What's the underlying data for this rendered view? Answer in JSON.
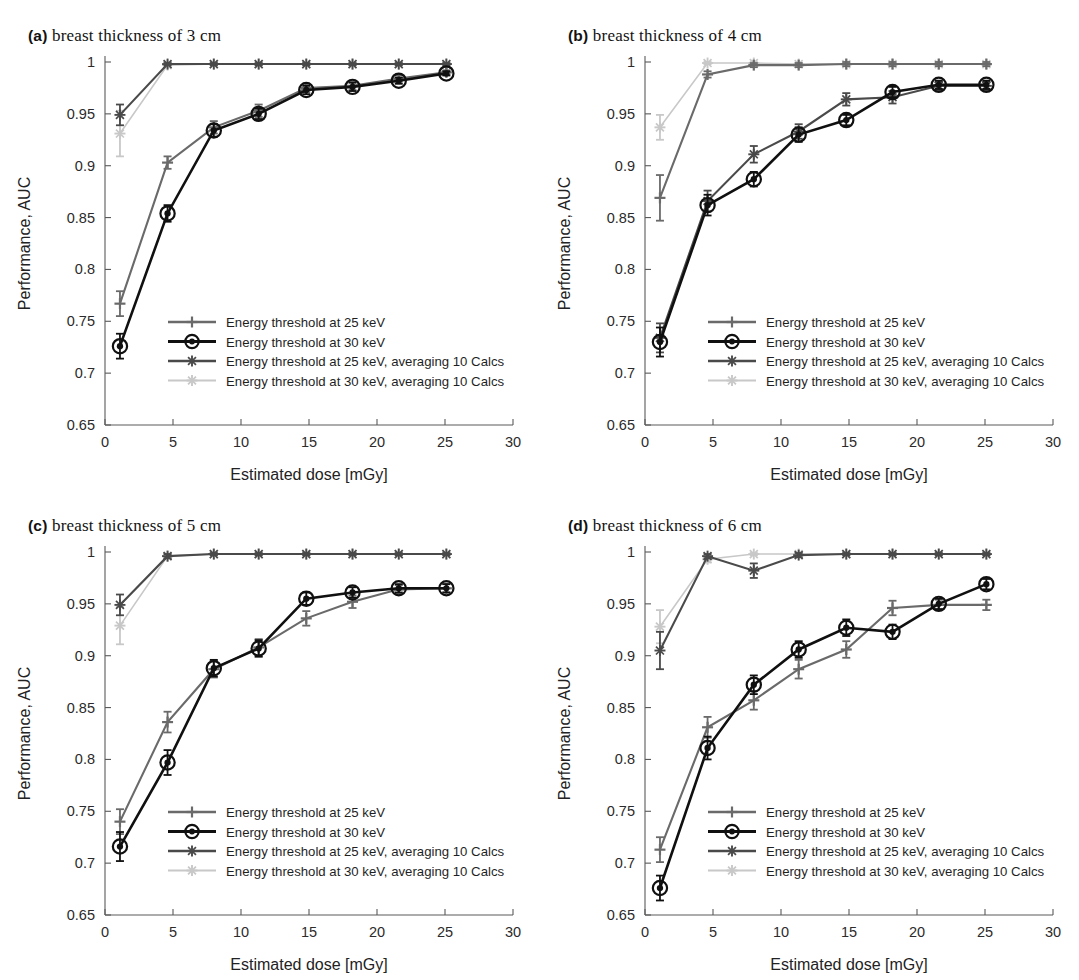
{
  "figure": {
    "axis": {
      "xlabel": "Estimated dose [mGy]",
      "ylabel": "Performance, AUC",
      "xlim": [
        0,
        30
      ],
      "ylim": [
        0.65,
        1.0
      ],
      "xticks": [
        "0",
        "5",
        "10",
        "15",
        "20",
        "25",
        "30"
      ],
      "xtick_values": [
        0,
        5,
        10,
        15,
        20,
        25,
        30
      ],
      "yticks": [
        "0.65",
        "0.7",
        "0.75",
        "0.8",
        "0.85",
        "0.9",
        "0.95",
        "1"
      ],
      "ytick_values": [
        0.65,
        0.7,
        0.75,
        0.8,
        0.85,
        0.9,
        0.95,
        1.0
      ],
      "grid": false
    },
    "legend": {
      "position": "lower-right-inside",
      "entries": [
        {
          "label": "Energy threshold at 25 keV",
          "marker": "plus",
          "color": "#6a6a6a"
        },
        {
          "label": "Energy threshold at 30 keV",
          "marker": "circle",
          "color": "#101010"
        },
        {
          "label": "Energy threshold at 25 keV, averaging 10 Calcs",
          "marker": "star",
          "color": "#4a4a4a"
        },
        {
          "label": "Energy threshold at 30 keV, averaging 10 Calcs",
          "marker": "star",
          "color": "#c8c8c8"
        }
      ]
    },
    "panels": [
      {
        "tag": "(a)",
        "title": "breast thickness of 3 cm"
      },
      {
        "tag": "(b)",
        "title": "breast thickness of 4 cm"
      },
      {
        "tag": "(c)",
        "title": "breast thickness of 5 cm"
      },
      {
        "tag": "(d)",
        "title": "breast thickness of 6 cm"
      }
    ]
  },
  "chart_data": [
    {
      "type": "line",
      "panel": "a",
      "title": "breast thickness of 3 cm",
      "xlabel": "Estimated dose [mGy]",
      "ylabel": "Performance, AUC",
      "xlim": [
        0,
        30
      ],
      "ylim": [
        0.65,
        1.0
      ],
      "x": [
        1.1,
        4.6,
        8.0,
        11.3,
        14.8,
        18.2,
        21.6,
        25.1
      ],
      "series": [
        {
          "name": "Energy threshold at 25 keV",
          "marker": "plus",
          "color": "#6a6a6a",
          "values": [
            0.767,
            0.903,
            0.937,
            0.953,
            0.975,
            0.977,
            0.984,
            0.99
          ],
          "errors": [
            0.012,
            0.006,
            0.006,
            0.006,
            0.004,
            0.004,
            0.003,
            0.002
          ]
        },
        {
          "name": "Energy threshold at 30 keV",
          "marker": "circle",
          "color": "#101010",
          "values": [
            0.726,
            0.854,
            0.934,
            0.95,
            0.973,
            0.976,
            0.982,
            0.989
          ],
          "errors": [
            0.012,
            0.008,
            0.006,
            0.005,
            0.004,
            0.004,
            0.003,
            0.002
          ]
        },
        {
          "name": "Energy threshold at 25 keV, averaging 10 Calcs",
          "marker": "star",
          "color": "#4a4a4a",
          "values": [
            0.949,
            0.998,
            0.998,
            0.998,
            0.998,
            0.998,
            0.998,
            0.998
          ],
          "errors": [
            0.01,
            0.001,
            0.001,
            0.001,
            0.001,
            0.001,
            0.001,
            0.001
          ]
        },
        {
          "name": "Energy threshold at 30 keV, averaging 10 Calcs",
          "marker": "star",
          "color": "#c8c8c8",
          "values": [
            0.931,
            0.997,
            0.998,
            0.998,
            0.998,
            0.998,
            0.998,
            0.998
          ],
          "errors": [
            0.022,
            0.002,
            0.001,
            0.001,
            0.001,
            0.001,
            0.001,
            0.001
          ]
        }
      ]
    },
    {
      "type": "line",
      "panel": "b",
      "title": "breast thickness of 4 cm",
      "xlabel": "Estimated dose [mGy]",
      "ylabel": "Performance, AUC",
      "xlim": [
        0,
        30
      ],
      "ylim": [
        0.65,
        1.0
      ],
      "x": [
        1.1,
        4.6,
        8.0,
        11.3,
        14.8,
        18.2,
        21.6,
        25.1
      ],
      "series": [
        {
          "name": "Energy threshold at 25 keV",
          "marker": "plus",
          "color": "#6a6a6a",
          "values": [
            0.869,
            0.988,
            0.997,
            0.997,
            0.998,
            0.998,
            0.998,
            0.998
          ],
          "errors": [
            0.022,
            0.003,
            0.002,
            0.002,
            0.002,
            0.002,
            0.002,
            0.002
          ]
        },
        {
          "name": "Energy threshold at 30 keV",
          "marker": "circle",
          "color": "#101010",
          "values": [
            0.73,
            0.862,
            0.887,
            0.93,
            0.944,
            0.971,
            0.978,
            0.978
          ],
          "errors": [
            0.014,
            0.01,
            0.007,
            0.007,
            0.005,
            0.005,
            0.004,
            0.004
          ]
        },
        {
          "name": "Energy threshold at 25 keV, averaging 10 Calcs",
          "marker": "star",
          "color": "#4a4a4a",
          "values": [
            0.734,
            0.866,
            0.911,
            0.933,
            0.964,
            0.966,
            0.977,
            0.977
          ],
          "errors": [
            0.014,
            0.01,
            0.008,
            0.007,
            0.006,
            0.006,
            0.004,
            0.004
          ]
        },
        {
          "name": "Energy threshold at 30 keV, averaging 10 Calcs",
          "marker": "star",
          "color": "#c8c8c8",
          "values": [
            0.937,
            0.999,
            0.999,
            0.998,
            0.998,
            0.998,
            0.998,
            0.998
          ],
          "errors": [
            0.012,
            0.001,
            0.001,
            0.001,
            0.001,
            0.001,
            0.001,
            0.001
          ]
        }
      ]
    },
    {
      "type": "line",
      "panel": "c",
      "title": "breast thickness of 5 cm",
      "xlabel": "Estimated dose [mGy]",
      "ylabel": "Performance, AUC",
      "xlim": [
        0,
        30
      ],
      "ylim": [
        0.65,
        1.0
      ],
      "x": [
        1.1,
        4.6,
        8.0,
        11.3,
        14.8,
        18.2,
        21.6,
        25.1
      ],
      "series": [
        {
          "name": "Energy threshold at 25 keV",
          "marker": "plus",
          "color": "#6a6a6a",
          "values": [
            0.74,
            0.836,
            0.887,
            0.908,
            0.936,
            0.952,
            0.964,
            0.965
          ],
          "errors": [
            0.012,
            0.01,
            0.008,
            0.008,
            0.007,
            0.006,
            0.004,
            0.004
          ]
        },
        {
          "name": "Energy threshold at 30 keV",
          "marker": "circle",
          "color": "#101010",
          "values": [
            0.716,
            0.797,
            0.888,
            0.907,
            0.955,
            0.961,
            0.965,
            0.965
          ],
          "errors": [
            0.014,
            0.012,
            0.008,
            0.008,
            0.006,
            0.005,
            0.004,
            0.004
          ]
        },
        {
          "name": "Energy threshold at 25 keV, averaging 10 Calcs",
          "marker": "star",
          "color": "#4a4a4a",
          "values": [
            0.949,
            0.996,
            0.998,
            0.998,
            0.998,
            0.998,
            0.998,
            0.998
          ],
          "errors": [
            0.01,
            0.002,
            0.001,
            0.001,
            0.001,
            0.001,
            0.001,
            0.001
          ]
        },
        {
          "name": "Energy threshold at 30 keV, averaging 10 Calcs",
          "marker": "star",
          "color": "#c8c8c8",
          "values": [
            0.929,
            0.996,
            0.998,
            0.998,
            0.998,
            0.998,
            0.998,
            0.998
          ],
          "errors": [
            0.018,
            0.002,
            0.001,
            0.001,
            0.001,
            0.001,
            0.001,
            0.001
          ]
        }
      ]
    },
    {
      "type": "line",
      "panel": "d",
      "title": "breast thickness of 6 cm",
      "xlabel": "Estimated dose [mGy]",
      "ylabel": "Performance, AUC",
      "xlim": [
        0,
        30
      ],
      "ylim": [
        0.65,
        1.0
      ],
      "x": [
        1.1,
        4.6,
        8.0,
        11.3,
        14.8,
        18.2,
        21.6,
        25.1
      ],
      "series": [
        {
          "name": "Energy threshold at 25 keV",
          "marker": "plus",
          "color": "#6a6a6a",
          "values": [
            0.713,
            0.831,
            0.857,
            0.887,
            0.906,
            0.946,
            0.949,
            0.949
          ],
          "errors": [
            0.012,
            0.01,
            0.009,
            0.009,
            0.008,
            0.007,
            0.005,
            0.005
          ]
        },
        {
          "name": "Energy threshold at 30 keV",
          "marker": "circle",
          "color": "#101010",
          "values": [
            0.676,
            0.811,
            0.872,
            0.906,
            0.927,
            0.923,
            0.95,
            0.969
          ],
          "errors": [
            0.012,
            0.011,
            0.009,
            0.008,
            0.008,
            0.007,
            0.005,
            0.005
          ]
        },
        {
          "name": "Energy threshold at 25 keV, averaging 10 Calcs",
          "marker": "star",
          "color": "#4a4a4a",
          "values": [
            0.905,
            0.996,
            0.982,
            0.997,
            0.998,
            0.998,
            0.998,
            0.998
          ],
          "errors": [
            0.018,
            0.002,
            0.007,
            0.002,
            0.001,
            0.001,
            0.001,
            0.001
          ]
        },
        {
          "name": "Energy threshold at 30 keV, averaging 10 Calcs",
          "marker": "star",
          "color": "#c8c8c8",
          "values": [
            0.928,
            0.993,
            0.998,
            0.998,
            0.998,
            0.998,
            0.998,
            0.998
          ],
          "errors": [
            0.016,
            0.003,
            0.001,
            0.001,
            0.001,
            0.001,
            0.001,
            0.001
          ]
        }
      ]
    }
  ]
}
